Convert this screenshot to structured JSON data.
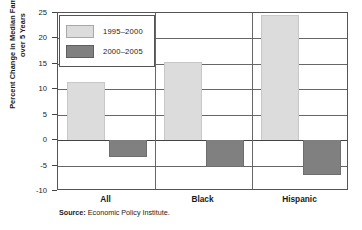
{
  "chart_data": {
    "type": "bar",
    "title": "",
    "xlabel": "",
    "ylabel": "Percent Change in Median Family Income over 5 Years",
    "categories": [
      "All",
      "Black",
      "Hispanic"
    ],
    "series": [
      {
        "name": "1995–2000",
        "color": "#dcdcdc",
        "values": [
          11.5,
          15.3,
          24.7
        ]
      },
      {
        "name": "2000–2005",
        "color": "#808080",
        "values": [
          -3.3,
          -5.2,
          -6.8
        ]
      }
    ],
    "ylim": [
      -10,
      25
    ],
    "yticks": [
      -10,
      -5,
      0,
      5,
      10,
      15,
      20,
      25
    ],
    "ytick_labels": [
      "-10",
      "-5",
      "0",
      "5",
      "10",
      "15",
      "20",
      "25"
    ],
    "grid": true,
    "legend_position": "top-left",
    "source_key": "Source:",
    "source_value": "Economic Policy Institute."
  }
}
